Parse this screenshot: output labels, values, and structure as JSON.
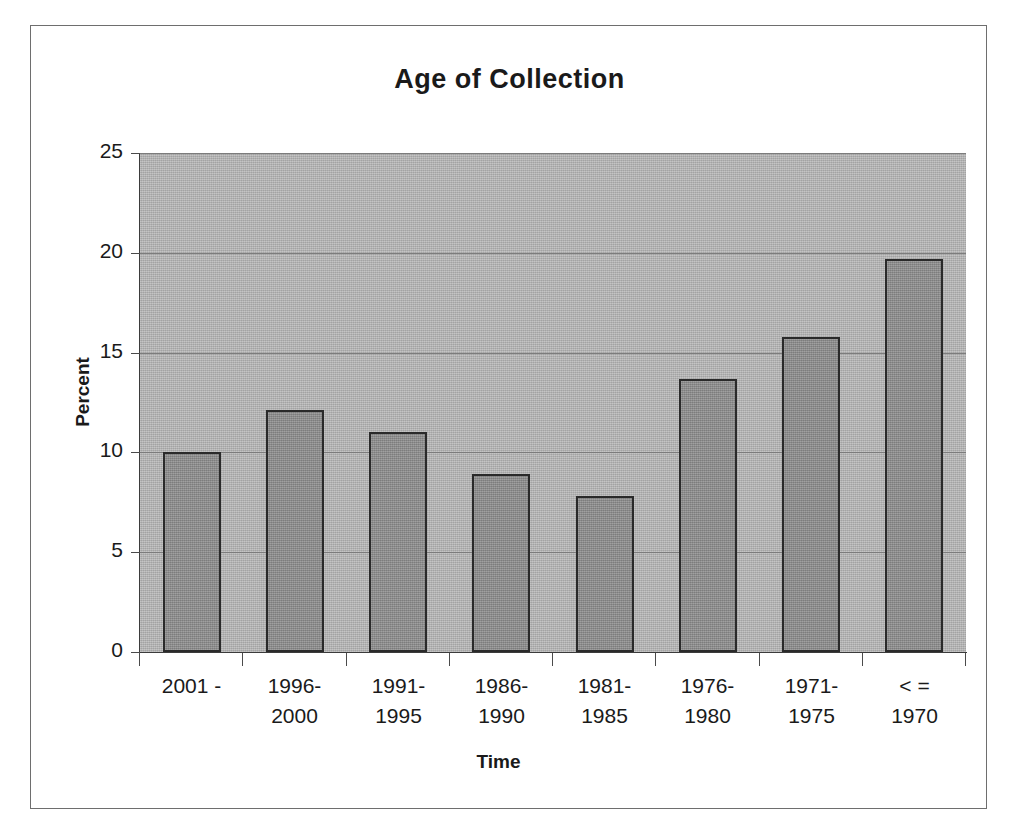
{
  "chart_data": {
    "type": "bar",
    "title": "Age of Collection",
    "xlabel": "Time",
    "ylabel": "Percent",
    "categories": [
      "2001 -",
      "1996-\n2000",
      "1991-\n1995",
      "1986-\n1990",
      "1981-\n1985",
      "1976-\n1980",
      "1971-\n1975",
      "< =\n1970"
    ],
    "values": [
      10.0,
      12.1,
      11.0,
      8.9,
      7.8,
      13.7,
      15.8,
      19.7
    ],
    "ylim": [
      0,
      25
    ],
    "ytick_labels": [
      "25",
      "20",
      "15",
      "10",
      "5",
      "0"
    ],
    "ytick_values": [
      25,
      20,
      15,
      10,
      5,
      0
    ],
    "grid": true,
    "legend": "none",
    "colors": {
      "bar_fill": "#8d8d8d",
      "bar_border": "#2a2a2a",
      "plot_background": "#b2b2b2",
      "gridline": "#7c7c7c",
      "axis": "#3b3b3b",
      "text": "#1a1a1a",
      "frame_border": "#6e6e6e",
      "page_background": "#ffffff"
    }
  }
}
